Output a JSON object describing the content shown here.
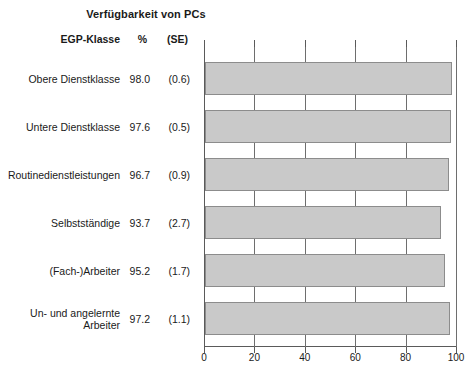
{
  "chart_data": {
    "type": "bar",
    "orientation": "horizontal",
    "title": "Verfügbarkeit von PCs",
    "xlabel": "",
    "ylabel": "",
    "xlim": [
      0,
      100
    ],
    "xticks": [
      "0",
      "20",
      "40",
      "60",
      "80",
      "100"
    ],
    "grid": true,
    "legend": false,
    "categories": [
      "Obere Dienstklasse",
      "Untere Dienstklasse",
      "Routinedienstleistungen",
      "Selbstständige",
      "(Fach-)Arbeiter",
      "Un- und angelernte\nArbeiter"
    ],
    "values": [
      98.0,
      97.6,
      96.7,
      93.7,
      95.2,
      97.2
    ],
    "errors": [
      0.6,
      0.5,
      0.9,
      2.7,
      1.7,
      1.1
    ],
    "value_labels": [
      "98.0",
      "97.6",
      "96.7",
      "93.7",
      "95.2",
      "97.2"
    ],
    "error_labels": [
      "(0.6)",
      "(0.5)",
      "(0.9)",
      "(2.7)",
      "(1.7)",
      "(1.1)"
    ],
    "bar_color": "#c9c9c9",
    "bar_border_color": "#8c8c8c"
  },
  "table": {
    "headers": {
      "category": "EGP-Klasse",
      "percent": "%",
      "se": "(SE)"
    },
    "rows": [
      {
        "category": "Obere Dienstklasse",
        "percent": "98.0",
        "se": "(0.6)"
      },
      {
        "category": "Untere Dienstklasse",
        "percent": "97.6",
        "se": "(0.5)"
      },
      {
        "category": "Routinedienstleistungen",
        "percent": "96.7",
        "se": "(0.9)"
      },
      {
        "category": "Selbstständige",
        "percent": "93.7",
        "se": "(2.7)"
      },
      {
        "category": "(Fach-)Arbeiter",
        "percent": "95.2",
        "se": "(1.7)"
      },
      {
        "category": "Un- und angelernte\nArbeiter",
        "percent": "97.2",
        "se": "(1.1)"
      }
    ]
  },
  "axis": {
    "ticks": [
      "0",
      "20",
      "40",
      "60",
      "80",
      "100"
    ]
  }
}
